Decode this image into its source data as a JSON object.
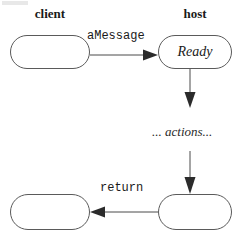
{
  "diagram": {
    "type": "uml-sequence-state-diagram",
    "columns": [
      {
        "id": "client",
        "label": "client"
      },
      {
        "id": "host",
        "label": "host"
      }
    ],
    "nodes": [
      {
        "id": "client-top",
        "label": "",
        "column": "client",
        "shape": "stadium"
      },
      {
        "id": "host-ready",
        "label": "Ready",
        "column": "host",
        "shape": "stadium",
        "style": "italic"
      },
      {
        "id": "client-bottom",
        "label": "",
        "column": "client",
        "shape": "stadium"
      },
      {
        "id": "host-bottom",
        "label": "",
        "column": "host",
        "shape": "stadium"
      }
    ],
    "edges": [
      {
        "id": "message-edge",
        "from": "client-top",
        "to": "host-ready",
        "label": "aMessage",
        "direction": "right"
      },
      {
        "id": "ready-to-actions-edge",
        "from": "host-ready",
        "to": "actions",
        "label": "",
        "direction": "down"
      },
      {
        "id": "actions-to-host-edge",
        "from": "actions",
        "to": "host-bottom",
        "label": "",
        "direction": "down"
      },
      {
        "id": "return-edge",
        "from": "host-bottom",
        "to": "client-bottom",
        "label": "return",
        "direction": "left"
      }
    ],
    "annotations": [
      {
        "id": "actions",
        "text": "... actions...",
        "style": "italic"
      }
    ],
    "colors": {
      "stroke": "#4a4a4a",
      "arrowhead": "#2b2b2b",
      "text": "#1a1a1a",
      "background": "#ffffff"
    }
  }
}
